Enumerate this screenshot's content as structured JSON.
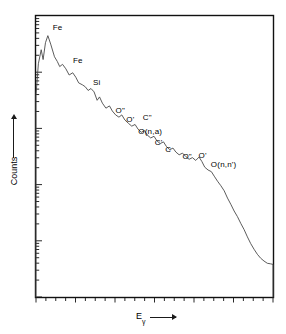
{
  "chart_data": {
    "type": "line",
    "title": "",
    "xlabel": "Eγ",
    "ylabel": "Counts",
    "xlabel_symbol": "E",
    "xlabel_subscript": "γ",
    "grid": false,
    "legend": "none",
    "axis_tick_labels": {
      "x": [],
      "y": []
    },
    "y_scale": "log",
    "x_scale": "linear",
    "annotations": [
      {
        "label": "Fe",
        "x": 0.075,
        "y": 0.955
      },
      {
        "label": "Fe",
        "x": 0.16,
        "y": 0.838
      },
      {
        "label": "Si",
        "x": 0.245,
        "y": 0.758
      },
      {
        "label": "O\"",
        "x": 0.34,
        "y": 0.66
      },
      {
        "label": "O'",
        "x": 0.385,
        "y": 0.625
      },
      {
        "label": "C\"",
        "x": 0.455,
        "y": 0.632
      },
      {
        "label": "O(n,a)",
        "x": 0.436,
        "y": 0.585
      },
      {
        "label": "C'",
        "x": 0.505,
        "y": 0.543
      },
      {
        "label": "C",
        "x": 0.55,
        "y": 0.52
      },
      {
        "label": "O\"",
        "x": 0.622,
        "y": 0.494
      },
      {
        "label": "O'",
        "x": 0.69,
        "y": 0.498
      },
      {
        "label": "O(n,n')",
        "x": 0.742,
        "y": 0.466
      }
    ],
    "series": [
      {
        "name": "spectrum",
        "points": [
          [
            0.0,
            0.0
          ],
          [
            0.0,
            0.718
          ],
          [
            0.01,
            0.83
          ],
          [
            0.022,
            0.88
          ],
          [
            0.03,
            0.845
          ],
          [
            0.04,
            0.905
          ],
          [
            0.05,
            0.93
          ],
          [
            0.062,
            0.9
          ],
          [
            0.078,
            0.855
          ],
          [
            0.09,
            0.838
          ],
          [
            0.1,
            0.82
          ],
          [
            0.112,
            0.828
          ],
          [
            0.126,
            0.812
          ],
          [
            0.14,
            0.79
          ],
          [
            0.155,
            0.798
          ],
          [
            0.168,
            0.782
          ],
          [
            0.18,
            0.762
          ],
          [
            0.196,
            0.755
          ],
          [
            0.208,
            0.748
          ],
          [
            0.22,
            0.735
          ],
          [
            0.232,
            0.742
          ],
          [
            0.245,
            0.73
          ],
          [
            0.258,
            0.7
          ],
          [
            0.268,
            0.712
          ],
          [
            0.28,
            0.69
          ],
          [
            0.295,
            0.672
          ],
          [
            0.31,
            0.68
          ],
          [
            0.322,
            0.662
          ],
          [
            0.336,
            0.648
          ],
          [
            0.35,
            0.64
          ],
          [
            0.362,
            0.648
          ],
          [
            0.375,
            0.63
          ],
          [
            0.39,
            0.618
          ],
          [
            0.404,
            0.608
          ],
          [
            0.418,
            0.614
          ],
          [
            0.43,
            0.598
          ],
          [
            0.444,
            0.586
          ],
          [
            0.458,
            0.592
          ],
          [
            0.47,
            0.576
          ],
          [
            0.484,
            0.566
          ],
          [
            0.498,
            0.572
          ],
          [
            0.51,
            0.556
          ],
          [
            0.524,
            0.546
          ],
          [
            0.538,
            0.552
          ],
          [
            0.55,
            0.536
          ],
          [
            0.564,
            0.524
          ],
          [
            0.578,
            0.53
          ],
          [
            0.59,
            0.516
          ],
          [
            0.604,
            0.506
          ],
          [
            0.618,
            0.512
          ],
          [
            0.632,
            0.5
          ],
          [
            0.646,
            0.49
          ],
          [
            0.66,
            0.496
          ],
          [
            0.674,
            0.486
          ],
          [
            0.688,
            0.498
          ],
          [
            0.7,
            0.482
          ],
          [
            0.712,
            0.462
          ],
          [
            0.726,
            0.452
          ],
          [
            0.74,
            0.446
          ],
          [
            0.752,
            0.43
          ],
          [
            0.766,
            0.412
          ],
          [
            0.78,
            0.396
          ],
          [
            0.794,
            0.378
          ],
          [
            0.808,
            0.352
          ],
          [
            0.822,
            0.33
          ],
          [
            0.836,
            0.306
          ],
          [
            0.85,
            0.286
          ],
          [
            0.864,
            0.262
          ],
          [
            0.878,
            0.24
          ],
          [
            0.892,
            0.214
          ],
          [
            0.906,
            0.19
          ],
          [
            0.92,
            0.17
          ],
          [
            0.934,
            0.152
          ],
          [
            0.948,
            0.138
          ],
          [
            0.962,
            0.128
          ],
          [
            0.976,
            0.12
          ],
          [
            0.99,
            0.118
          ],
          [
            1.0,
            0.116
          ],
          [
            1.0,
            0.0
          ]
        ]
      }
    ]
  },
  "axes": {
    "y_axis_name": "Counts",
    "x_axis_name": "E",
    "x_axis_subscript": "γ"
  },
  "style": {
    "line_color": "#4a4a4a",
    "frame_color": "#111111",
    "background": "#ffffff",
    "text_color": "#000000"
  }
}
